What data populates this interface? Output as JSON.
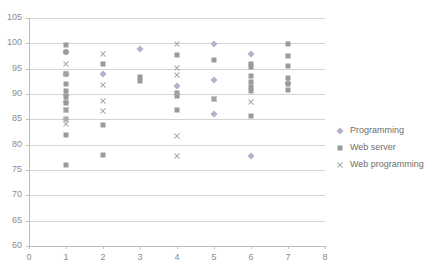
{
  "chart_data": {
    "type": "scatter",
    "title": "",
    "xlabel": "",
    "ylabel": "",
    "xlim": [
      0,
      8
    ],
    "ylim": [
      60,
      105
    ],
    "xticks": [
      0,
      1,
      2,
      3,
      4,
      5,
      6,
      7,
      8
    ],
    "yticks": [
      60,
      65,
      70,
      75,
      80,
      85,
      90,
      95,
      100,
      105
    ],
    "grid": "horizontal",
    "legend_position": "right",
    "series": [
      {
        "name": "Programming",
        "marker": "diamond",
        "color": "#b6b0c8",
        "points": [
          [
            1,
            98.2
          ],
          [
            1,
            94.0
          ],
          [
            1,
            89.8
          ],
          [
            1,
            88.5
          ],
          [
            1,
            85.0
          ],
          [
            2,
            94.0
          ],
          [
            3,
            98.8
          ],
          [
            4,
            91.5
          ],
          [
            5,
            99.8
          ],
          [
            5,
            92.8
          ],
          [
            5,
            86.0
          ],
          [
            6,
            97.9
          ],
          [
            6,
            77.8
          ],
          [
            7,
            92.2
          ]
        ]
      },
      {
        "name": "Web server",
        "marker": "square",
        "color": "#9a9a9a",
        "points": [
          [
            1,
            99.6
          ],
          [
            1,
            98.2
          ],
          [
            1,
            93.9
          ],
          [
            1,
            92.0
          ],
          [
            1,
            90.5
          ],
          [
            1,
            89.5
          ],
          [
            1,
            88.3
          ],
          [
            1,
            86.9
          ],
          [
            1,
            81.9
          ],
          [
            1,
            75.9
          ],
          [
            2,
            95.9
          ],
          [
            2,
            83.9
          ],
          [
            2,
            77.9
          ],
          [
            3,
            93.4
          ],
          [
            3,
            92.6
          ],
          [
            4,
            97.7
          ],
          [
            4,
            90.1
          ],
          [
            4,
            89.6
          ],
          [
            4,
            86.8
          ],
          [
            5,
            96.7
          ],
          [
            5,
            89.0
          ],
          [
            6,
            95.9
          ],
          [
            6,
            95.3
          ],
          [
            6,
            93.6
          ],
          [
            6,
            92.3
          ],
          [
            6,
            91.3
          ],
          [
            6,
            90.6
          ],
          [
            6,
            85.7
          ],
          [
            7,
            99.8
          ],
          [
            7,
            97.5
          ],
          [
            7,
            95.5
          ],
          [
            7,
            93.1
          ],
          [
            7,
            91.9
          ],
          [
            7,
            90.7
          ]
        ]
      },
      {
        "name": "Web programming",
        "marker": "cross",
        "color": "#a8a8a8",
        "points": [
          [
            1,
            96.0
          ],
          [
            1,
            93.9
          ],
          [
            1,
            86.9
          ],
          [
            1,
            85.0
          ],
          [
            1,
            84.0
          ],
          [
            2,
            97.8
          ],
          [
            2,
            91.8
          ],
          [
            2,
            88.7
          ],
          [
            2,
            86.7
          ],
          [
            4,
            99.9
          ],
          [
            4,
            95.1
          ],
          [
            4,
            93.7
          ],
          [
            4,
            90.0
          ],
          [
            4,
            81.8
          ],
          [
            4,
            77.7
          ],
          [
            5,
            89.0
          ],
          [
            6,
            88.5
          ]
        ]
      }
    ]
  },
  "legend": {
    "items": [
      {
        "label": "Programming",
        "marker": "diamond"
      },
      {
        "label": "Web server",
        "marker": "square"
      },
      {
        "label": "Web programming",
        "marker": "cross"
      }
    ]
  },
  "colors": {
    "programming": "#b6b0c8",
    "web_server": "#9a9a9a",
    "web_programming": "#a8a8a8",
    "gridline": "#d4d4d4",
    "axis": "#bdbdbd",
    "tick_text": "#8c8c8c",
    "legend_text": "#6e6e6e"
  }
}
